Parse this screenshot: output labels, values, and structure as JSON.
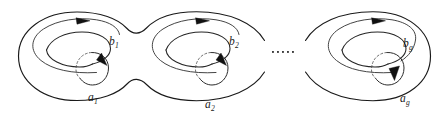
{
  "figure": {
    "background_color": "#ffffff",
    "stroke_color": "#1a1a1a",
    "width": 447,
    "height": 122,
    "ellipsis": "....."
  },
  "handles": [
    {
      "index": 1,
      "b_label_base": "b",
      "b_label_sub": "1",
      "a_label_base": "a",
      "a_label_sub": "1",
      "b_label_text": "b1",
      "a_label_text": "a1"
    },
    {
      "index": 2,
      "b_label_base": "b",
      "b_label_sub": "2",
      "a_label_base": "a",
      "a_label_sub": "2",
      "b_label_text": "b2",
      "a_label_text": "a2"
    },
    {
      "index": 3,
      "b_label_base": "b",
      "b_label_sub": "g",
      "a_label_base": "a",
      "a_label_sub": "g",
      "b_label_text": "bg",
      "a_label_text": "ag"
    }
  ]
}
